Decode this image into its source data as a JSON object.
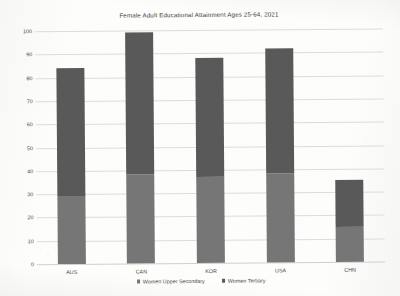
{
  "chart_data": {
    "type": "bar",
    "title": "Female Adult Educational Attainment Ages 25-64, 2021",
    "xlabel": "",
    "ylabel": "",
    "ylim": [
      0,
      100
    ],
    "yticks": [
      0,
      10,
      20,
      30,
      40,
      50,
      60,
      70,
      80,
      90,
      100
    ],
    "grid": true,
    "stacked": true,
    "legend_position": "bottom",
    "categories": [
      "AUS",
      "CAN",
      "KOR",
      "USA",
      "CHN"
    ],
    "series": [
      {
        "name": "Women Upper Secondary",
        "color": "#767676",
        "values": [
          29,
          38,
          37,
          38,
          15
        ]
      },
      {
        "name": "Women Tertiary",
        "color": "#595959",
        "values": [
          55,
          61,
          51,
          54,
          20
        ]
      }
    ],
    "totals": [
      84,
      99,
      88,
      92,
      35
    ]
  },
  "legend": {
    "items": [
      {
        "label": "Women Upper Secondary",
        "swatch": "legend-swatch-upper-secondary"
      },
      {
        "label": "Women Tertiary",
        "swatch": "legend-swatch-tertiary"
      }
    ]
  }
}
